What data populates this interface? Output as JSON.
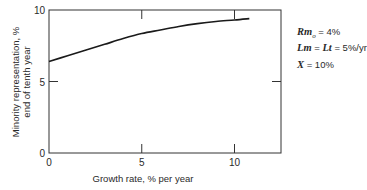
{
  "chart_data": {
    "type": "line",
    "title": "",
    "xlabel": "Growth rate, % per year",
    "ylabel_lines": [
      "Minority representation, %",
      "end of tenth year"
    ],
    "ylabel": "Minority representation, % end of tenth year",
    "xlim": [
      0,
      13
    ],
    "ylim": [
      0,
      10
    ],
    "x_ticks": [
      0,
      5,
      10
    ],
    "y_ticks": [
      0,
      5,
      10
    ],
    "x_tick_labels": [
      "0",
      "5",
      "10"
    ],
    "y_tick_labels": [
      "0",
      "5",
      "10"
    ],
    "grid": false,
    "legend": null,
    "series": [
      {
        "name": "Minority representation",
        "x": [
          0,
          1,
          2,
          3,
          4,
          5,
          6,
          7,
          8,
          9,
          10,
          10.8
        ],
        "y": [
          6.4,
          6.8,
          7.2,
          7.6,
          8.0,
          8.35,
          8.6,
          8.85,
          9.05,
          9.2,
          9.3,
          9.4
        ]
      }
    ],
    "annotations": [
      {
        "var": "Rm",
        "sub": "o",
        "value": "= 4%"
      },
      {
        "var": "Lm",
        "mid": "= ",
        "var2": "Lt",
        "value": "= 5%/yr"
      },
      {
        "var": "X",
        "value": "= 10%"
      }
    ]
  },
  "annotations": {
    "line1": {
      "var": "Rm",
      "sub": "o",
      "rest": " = 4%"
    },
    "line2": {
      "var": "Lm",
      "eq": " = ",
      "var2": "Lt",
      "rest": " = 5%/yr"
    },
    "line3": {
      "var": "X",
      "rest": " = 10%"
    }
  },
  "axis": {
    "xlabel": "Growth rate, % per year",
    "ylabel_1": "Minority representation, %",
    "ylabel_2": "end of tenth year"
  }
}
